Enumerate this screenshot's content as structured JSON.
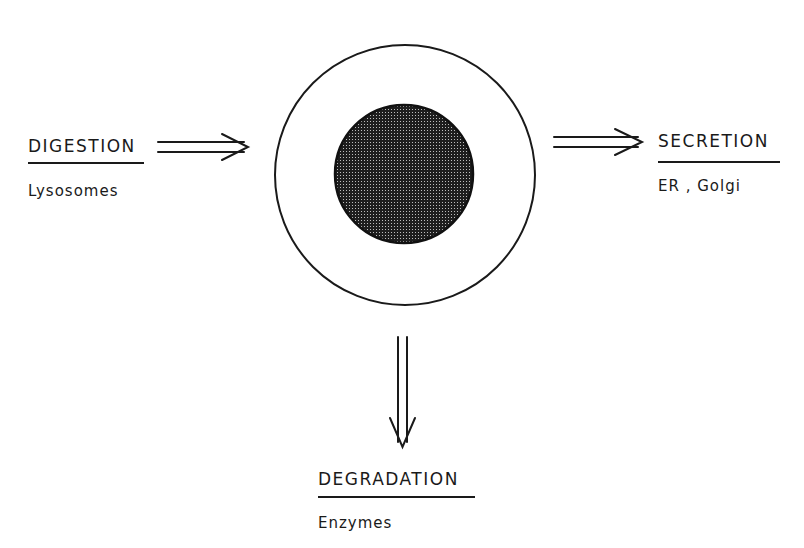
{
  "diagram": {
    "center": {
      "outer_label": "cell",
      "inner_label": "nucleus"
    },
    "nodes": [
      {
        "id": "digestion",
        "title": "DIGESTION",
        "subtitle": "Lysosomes",
        "direction": "in-from-left"
      },
      {
        "id": "secretion",
        "title": "SECRETION",
        "subtitle": "ER , Golgi",
        "direction": "out-to-right"
      },
      {
        "id": "degradation",
        "title": "DEGRADATION",
        "subtitle": "Enzymes",
        "direction": "out-downward"
      }
    ],
    "colors": {
      "line": "#1a1a1a",
      "nucleus_fill": "#2a2a2a",
      "background": "#ffffff"
    }
  }
}
